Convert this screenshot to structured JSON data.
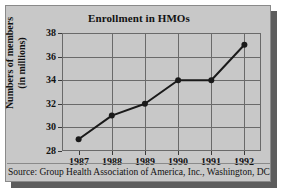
{
  "figure": {
    "title": "Enrollment in HMOs",
    "source_note": "Source: Group Health Association of America, Inc., Washington, DC",
    "panel_color": "#c8c8c8",
    "frame_color": "#6a6a6a",
    "shadow_color": "#5d5d5d",
    "series_color": "#1a1a1a"
  },
  "ylabel_line1": "Numbers of members",
  "ylabel_line2": "(in millions)",
  "chart_data": {
    "type": "line",
    "title": "Enrollment in HMOs",
    "xlabel": "",
    "ylabel": "Numbers of members (in millions)",
    "categories": [
      "1987",
      "1988",
      "1989",
      "1990",
      "1991",
      "1992"
    ],
    "x": [
      1987,
      1988,
      1989,
      1990,
      1991,
      1992
    ],
    "values": [
      29,
      31,
      32,
      34,
      34,
      37
    ],
    "ylim": [
      28,
      38
    ],
    "yticks": [
      28,
      30,
      32,
      34,
      36,
      38
    ],
    "ytick_labels": [
      "28",
      "30",
      "32",
      "34",
      "36",
      "38"
    ],
    "xtick_labels": [
      "1987",
      "1988",
      "1989",
      "1990",
      "1991",
      "1992"
    ],
    "grid": true,
    "legend": null,
    "markers": "filled-circle",
    "annotations": [
      "Source: Group Health Association of America, Inc., Washington, DC"
    ]
  }
}
